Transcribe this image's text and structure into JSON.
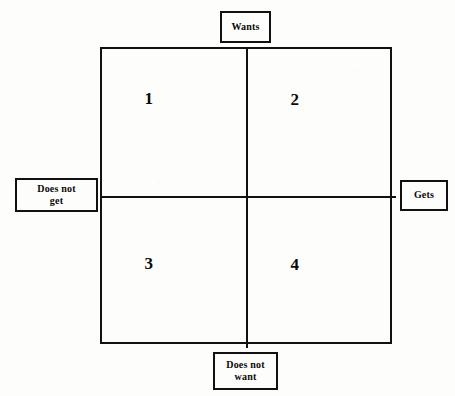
{
  "diagram": {
    "type": "2x2-quadrant-matrix",
    "axes": {
      "top_label": "Wants",
      "bottom_label": "Does not\nwant",
      "left_label": "Does not\nget",
      "right_label": "Gets"
    },
    "quadrants": [
      {
        "id": 1,
        "number": "1",
        "position": "top-left",
        "meaning": "Wants / Does not get"
      },
      {
        "id": 2,
        "number": "2",
        "position": "top-right",
        "meaning": "Wants / Gets"
      },
      {
        "id": 3,
        "number": "3",
        "position": "bottom-left",
        "meaning": "Does not want / Does not get"
      },
      {
        "id": 4,
        "number": "4",
        "position": "bottom-right",
        "meaning": "Does not want / Gets"
      }
    ],
    "colors": {
      "line": "#111111",
      "background": "#fdfdfb",
      "text": "#0a0a0a"
    }
  }
}
